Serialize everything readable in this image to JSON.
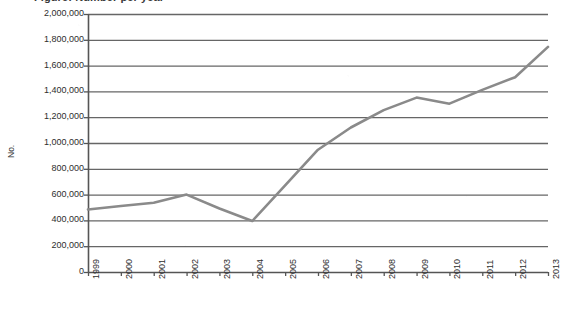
{
  "chart_data": {
    "type": "line",
    "title": "",
    "xlabel": "",
    "ylabel": "No.",
    "categories": [
      "1999",
      "2000",
      "2001",
      "2002",
      "2003",
      "2004",
      "2005",
      "2006",
      "2007",
      "2008",
      "2009",
      "2010",
      "2011",
      "2012",
      "2013"
    ],
    "values": [
      485000,
      512000,
      537000,
      600000,
      492000,
      395000,
      672000,
      948000,
      1120000,
      1255000,
      1352000,
      1305000,
      1412000,
      1510000,
      1745000
    ],
    "series": [
      {
        "name": "No.",
        "values": [
          485000,
          512000,
          537000,
          600000,
          492000,
          395000,
          672000,
          948000,
          1120000,
          1255000,
          1352000,
          1305000,
          1412000,
          1510000,
          1745000
        ]
      }
    ],
    "ylim": [
      0,
      2000000
    ],
    "y_tick_step": 200000,
    "y_tick_labels": [
      "2,000,000",
      "1,800,000",
      "1,600,000",
      "1,400,000",
      "1,200,000",
      "1,000,000",
      "800,000",
      "600,000",
      "400,000",
      "200,000",
      "0"
    ],
    "y_tick_values": [
      2000000,
      1800000,
      1600000,
      1400000,
      1200000,
      1000000,
      800000,
      600000,
      400000,
      200000,
      0
    ],
    "x_tick_labels": [
      "1999",
      "2000",
      "2001",
      "2002",
      "2003",
      "2004",
      "2005",
      "2006",
      "2007",
      "2008",
      "2009",
      "2010",
      "2011",
      "2012",
      "2013"
    ],
    "grid": "horizontal",
    "legend": "none",
    "line_color": "#8a8a8a",
    "axis_color": "#555555",
    "grid_color": "#666666",
    "background_color": "#ffffff"
  },
  "figure": {
    "cropped_title_text": "Figure: Number per year",
    "y_axis_title": "No.",
    "zero_label": "0"
  }
}
